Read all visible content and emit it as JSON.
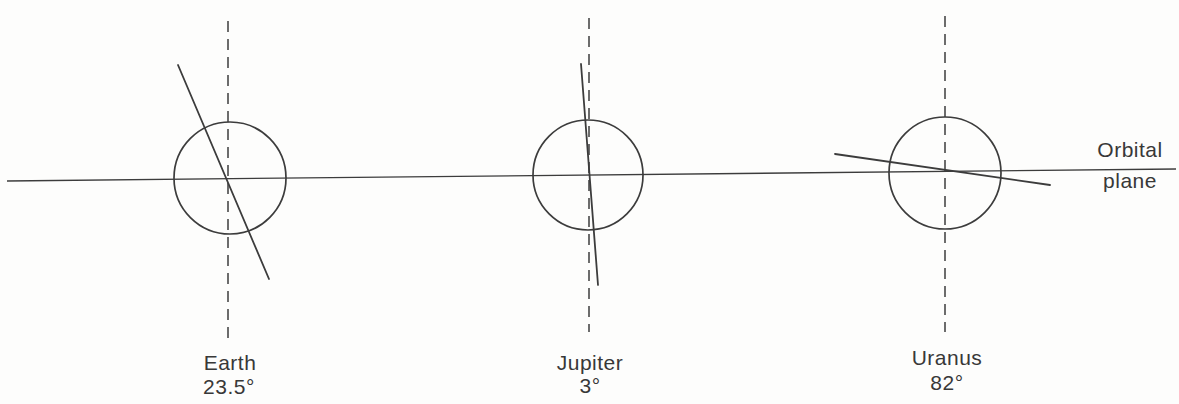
{
  "orbital_plane": {
    "label_line1": "Orbital",
    "label_line2": "plane",
    "line": {
      "x1": 7,
      "y1": 181,
      "x2": 1176,
      "y2": 169
    },
    "label": {
      "x": 1130,
      "y1": 157,
      "y2": 188
    }
  },
  "planets": [
    {
      "name": "Earth",
      "tilt": "23.5°",
      "cx": 230,
      "cy": 178,
      "r": 56,
      "dash": {
        "x": 228,
        "y1": 21,
        "y2": 339
      },
      "axis": {
        "x1": 178,
        "y1": 65,
        "x2": 269,
        "y2": 279
      },
      "label": {
        "x": 230,
        "y": 370
      },
      "tilt_label": {
        "x": 229,
        "y": 394
      }
    },
    {
      "name": "Jupiter",
      "tilt": "3°",
      "cx": 588,
      "cy": 175,
      "r": 55,
      "dash": {
        "x": 589,
        "y1": 18,
        "y2": 332
      },
      "axis": {
        "x1": 581,
        "y1": 64,
        "x2": 598,
        "y2": 285
      },
      "label": {
        "x": 590,
        "y": 370
      },
      "tilt_label": {
        "x": 590,
        "y": 393
      }
    },
    {
      "name": "Uranus",
      "tilt": "82°",
      "cx": 945,
      "cy": 173,
      "r": 56,
      "dash": {
        "x": 945,
        "y1": 16,
        "y2": 332
      },
      "axis": {
        "x1": 835,
        "y1": 154,
        "x2": 1050,
        "y2": 185
      },
      "label": {
        "x": 947,
        "y": 365
      },
      "tilt_label": {
        "x": 947,
        "y": 390
      }
    }
  ],
  "colors": {
    "line": "#3c3c3c",
    "text": "#383838",
    "background": "#fdfdfc"
  }
}
